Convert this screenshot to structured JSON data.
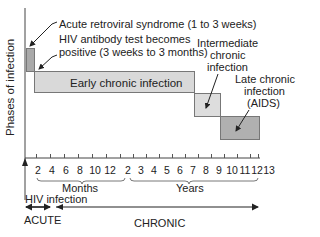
{
  "diagram": {
    "y_axis_label": "Phases of infection",
    "phases": [
      {
        "name": "Acute retroviral syndrome",
        "label": "Acute retroviral syndrome (1 to 3 weeks)",
        "color": "#a9a9a9"
      },
      {
        "name": "HIV antibody test",
        "label_line1": "HIV antibody test becomes",
        "label_line2": "positive (3 weeks to 3 months)"
      },
      {
        "name": "Early chronic infection",
        "label": "Early chronic infection",
        "color": "#d9d9d9"
      },
      {
        "name": "Intermediate chronic infection",
        "label_line1": "Intermediate",
        "label_line2": "chronic",
        "label_line3": "infection",
        "color": "#dddddd"
      },
      {
        "name": "Late chronic infection",
        "label_line1": "Late chronic",
        "label_line2": "infection",
        "label_line3": "(AIDS)",
        "color": "#b0b0b0"
      }
    ],
    "months_ticks": [
      "2",
      "4",
      "6",
      "8",
      "10",
      "12"
    ],
    "years_ticks": [
      "2",
      "3",
      "4",
      "5",
      "6",
      "7",
      "8",
      "9",
      "10",
      "11",
      "12",
      "13"
    ],
    "months_label": "Months",
    "years_label": "Years",
    "start_label": "HIV infection",
    "acute_label": "ACUTE",
    "chronic_label": "CHRONIC"
  }
}
